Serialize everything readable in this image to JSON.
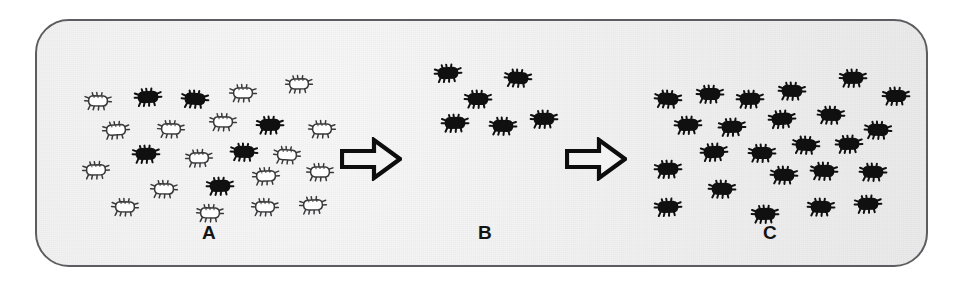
{
  "figure": {
    "background_color": "#efeff0",
    "frame_border_color": "#5d5d61",
    "susceptible_color": "#ffffff",
    "resistant_color": "#101010",
    "outline_color": "#3a3a3c"
  },
  "panels": [
    {
      "id": "A",
      "label": "A",
      "caption": "A",
      "description": "Mixed population of susceptible (white) and resistant (black) insects",
      "total_count": 23,
      "black_count": 5,
      "white_count": 18,
      "bugs": [
        {
          "x": 30,
          "y": 70,
          "fill": "white"
        },
        {
          "x": 80,
          "y": 66,
          "fill": "black"
        },
        {
          "x": 127,
          "y": 68,
          "fill": "black"
        },
        {
          "x": 175,
          "y": 62,
          "fill": "white"
        },
        {
          "x": 231,
          "y": 53,
          "fill": "white"
        },
        {
          "x": 155,
          "y": 91,
          "fill": "white"
        },
        {
          "x": 202,
          "y": 94,
          "fill": "black"
        },
        {
          "x": 254,
          "y": 98,
          "fill": "white"
        },
        {
          "x": 48,
          "y": 99,
          "fill": "white"
        },
        {
          "x": 103,
          "y": 98,
          "fill": "white"
        },
        {
          "x": 78,
          "y": 123,
          "fill": "black"
        },
        {
          "x": 131,
          "y": 127,
          "fill": "white"
        },
        {
          "x": 176,
          "y": 121,
          "fill": "black"
        },
        {
          "x": 219,
          "y": 124,
          "fill": "white"
        },
        {
          "x": 28,
          "y": 139,
          "fill": "white"
        },
        {
          "x": 198,
          "y": 145,
          "fill": "white"
        },
        {
          "x": 252,
          "y": 141,
          "fill": "white"
        },
        {
          "x": 152,
          "y": 155,
          "fill": "black"
        },
        {
          "x": 96,
          "y": 158,
          "fill": "white"
        },
        {
          "x": 57,
          "y": 176,
          "fill": "white"
        },
        {
          "x": 142,
          "y": 182,
          "fill": "white"
        },
        {
          "x": 197,
          "y": 176,
          "fill": "white"
        },
        {
          "x": 245,
          "y": 174,
          "fill": "white"
        }
      ]
    },
    {
      "id": "B",
      "label": "B",
      "caption": "B",
      "description": "Surviving resistant insects after insecticide application",
      "total_count": 6,
      "black_count": 6,
      "white_count": 0,
      "bugs": [
        {
          "x": 18,
          "y": 42,
          "fill": "black"
        },
        {
          "x": 88,
          "y": 47,
          "fill": "black"
        },
        {
          "x": 48,
          "y": 68,
          "fill": "black"
        },
        {
          "x": 25,
          "y": 92,
          "fill": "black"
        },
        {
          "x": 73,
          "y": 95,
          "fill": "black"
        },
        {
          "x": 114,
          "y": 88,
          "fill": "black"
        }
      ]
    },
    {
      "id": "C",
      "label": "C",
      "caption": "C",
      "description": "Resistant population after reproduction",
      "total_count": 24,
      "black_count": 24,
      "white_count": 0,
      "bugs": [
        {
          "x": 16,
          "y": 68,
          "fill": "black"
        },
        {
          "x": 58,
          "y": 63,
          "fill": "black"
        },
        {
          "x": 98,
          "y": 68,
          "fill": "black"
        },
        {
          "x": 140,
          "y": 60,
          "fill": "black"
        },
        {
          "x": 201,
          "y": 47,
          "fill": "black"
        },
        {
          "x": 244,
          "y": 65,
          "fill": "black"
        },
        {
          "x": 130,
          "y": 88,
          "fill": "black"
        },
        {
          "x": 179,
          "y": 84,
          "fill": "black"
        },
        {
          "x": 36,
          "y": 94,
          "fill": "black"
        },
        {
          "x": 80,
          "y": 96,
          "fill": "black"
        },
        {
          "x": 226,
          "y": 99,
          "fill": "black"
        },
        {
          "x": 154,
          "y": 114,
          "fill": "black"
        },
        {
          "x": 197,
          "y": 113,
          "fill": "black"
        },
        {
          "x": 62,
          "y": 121,
          "fill": "black"
        },
        {
          "x": 110,
          "y": 122,
          "fill": "black"
        },
        {
          "x": 16,
          "y": 138,
          "fill": "black"
        },
        {
          "x": 132,
          "y": 144,
          "fill": "black"
        },
        {
          "x": 172,
          "y": 140,
          "fill": "black"
        },
        {
          "x": 221,
          "y": 141,
          "fill": "black"
        },
        {
          "x": 70,
          "y": 158,
          "fill": "black"
        },
        {
          "x": 16,
          "y": 176,
          "fill": "black"
        },
        {
          "x": 113,
          "y": 183,
          "fill": "black"
        },
        {
          "x": 169,
          "y": 176,
          "fill": "black"
        },
        {
          "x": 216,
          "y": 173,
          "fill": "black"
        }
      ]
    }
  ],
  "arrows": [
    {
      "id": "arrow-a-to-b",
      "direction": "right",
      "label": "transition A to B"
    },
    {
      "id": "arrow-b-to-c",
      "direction": "right",
      "label": "transition B to C"
    }
  ]
}
